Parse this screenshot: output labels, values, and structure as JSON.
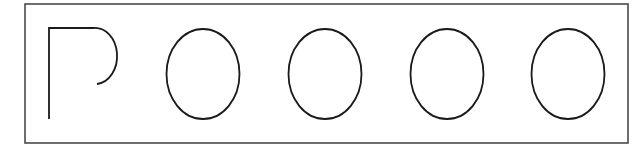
{
  "figure": {
    "background": "#ffffff",
    "stroke_color": "#1a1a1a",
    "frame": {
      "x": 25,
      "y": 4,
      "width": 603,
      "height": 139,
      "stroke_color": "#4a4a4a",
      "stroke_width": 1.6
    },
    "shapes": [
      {
        "name": "p-shape",
        "type": "path",
        "d": "M 49 119 L 49 28 L 93 28 A 22 28 0 0 1 97 84",
        "stroke_width": 1.8
      },
      {
        "name": "oval-1",
        "type": "ellipse",
        "cx": 203,
        "cy": 74,
        "rx": 36.5,
        "ry": 45,
        "stroke_width": 1.8
      },
      {
        "name": "oval-2",
        "type": "ellipse",
        "cx": 325,
        "cy": 74,
        "rx": 36.5,
        "ry": 45,
        "stroke_width": 1.8
      },
      {
        "name": "oval-3",
        "type": "ellipse",
        "cx": 447,
        "cy": 74,
        "rx": 36.5,
        "ry": 45,
        "stroke_width": 1.8
      },
      {
        "name": "oval-4",
        "type": "ellipse",
        "cx": 568,
        "cy": 74,
        "rx": 36.5,
        "ry": 45,
        "stroke_width": 1.8
      }
    ]
  }
}
